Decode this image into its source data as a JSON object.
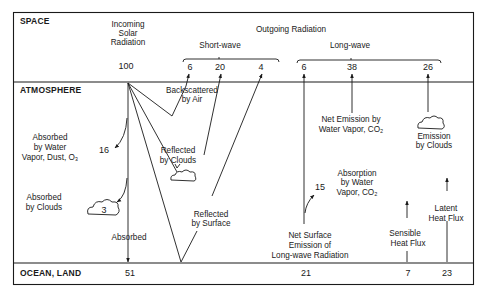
{
  "zones": {
    "space": "SPACE",
    "atmosphere": "ATMOSPHERE",
    "surface": "OCEAN, LAND"
  },
  "incoming": {
    "title_lines": [
      "Incoming",
      "Solar",
      "Radiation"
    ],
    "value": "100"
  },
  "outgoing": {
    "title": "Outgoing Radiation",
    "shortwave": {
      "label": "Short-wave",
      "values": [
        "6",
        "20",
        "4"
      ]
    },
    "longwave": {
      "label": "Long-wave",
      "values": [
        "6",
        "38",
        "26"
      ]
    }
  },
  "atmosphere_labels": {
    "backscattered": [
      "Backscattered",
      "by Air"
    ],
    "absorbed_vapor": [
      "Absorbed",
      "by Water",
      "Vapor, Dust, O₃"
    ],
    "absorbed_vapor_value": "16",
    "absorbed_clouds": [
      "Absorbed",
      "by Clouds"
    ],
    "absorbed_clouds_value": "3",
    "reflected_clouds": [
      "Reflected",
      "by Clouds"
    ],
    "reflected_surface": [
      "Reflected",
      "by Surface"
    ],
    "absorbed_surface": "Absorbed",
    "net_emission": [
      "Net Emission by",
      "Water Vapor, CO₂"
    ],
    "emission_clouds": [
      "Emission",
      "by Clouds"
    ],
    "absorption_vapor": [
      "Absorption",
      "by Water",
      "Vapor, CO₂"
    ],
    "absorption_vapor_value": "15",
    "net_surface": [
      "Net Surface",
      "Emission of",
      "Long-wave Radiation"
    ],
    "sensible": [
      "Sensible",
      "Heat  Flux"
    ],
    "latent": [
      "Latent",
      "Heat Flux"
    ]
  },
  "surface_values": {
    "absorbed": "51",
    "longwave_net": "21",
    "sensible": "7",
    "latent": "23"
  },
  "colors": {
    "ink": "#1a1a1a",
    "paper": "#ffffff"
  }
}
